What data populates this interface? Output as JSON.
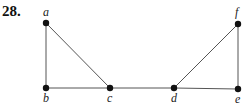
{
  "problem_number": "28.",
  "graph": {
    "nodes": [
      {
        "id": "a",
        "label": "a",
        "x": 46,
        "y": 23,
        "lx": 43,
        "ly": 16
      },
      {
        "id": "b",
        "label": "b",
        "x": 46,
        "y": 88,
        "lx": 43,
        "ly": 102
      },
      {
        "id": "c",
        "label": "c",
        "x": 110,
        "y": 88,
        "lx": 107,
        "ly": 102
      },
      {
        "id": "d",
        "label": "d",
        "x": 174,
        "y": 88,
        "lx": 171,
        "ly": 102
      },
      {
        "id": "e",
        "label": "e",
        "x": 238,
        "y": 89,
        "lx": 235,
        "ly": 103
      },
      {
        "id": "f",
        "label": "f",
        "x": 238,
        "y": 24,
        "lx": 235,
        "ly": 16
      }
    ],
    "edges": [
      [
        "a",
        "b"
      ],
      [
        "a",
        "c"
      ],
      [
        "b",
        "c"
      ],
      [
        "c",
        "d"
      ],
      [
        "d",
        "e"
      ],
      [
        "d",
        "f"
      ],
      [
        "f",
        "e"
      ]
    ]
  }
}
